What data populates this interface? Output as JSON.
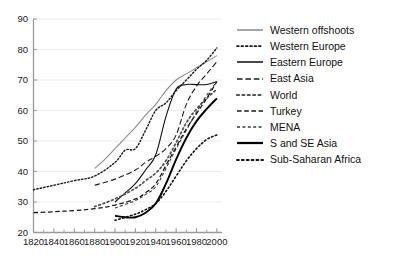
{
  "chart_data": {
    "type": "line",
    "title": "",
    "subtitle": "",
    "xlabel": "",
    "ylabel": "",
    "xlim": [
      1820,
      2005
    ],
    "ylim": [
      20,
      90
    ],
    "xticks": [
      1820,
      1840,
      1860,
      1880,
      1900,
      1920,
      1940,
      1960,
      1980,
      2000
    ],
    "xtick_labels": [
      "1820",
      "1840",
      "1860",
      "1880",
      "1900",
      "1920",
      "1940",
      "1960",
      "1980",
      "2000"
    ],
    "xminor_interval": 10,
    "yticks": [
      20,
      30,
      40,
      50,
      60,
      70,
      80,
      90
    ],
    "ytick_labels": [
      "20",
      "30",
      "40",
      "50",
      "60",
      "70",
      "80",
      "90"
    ],
    "grid": "horizontal",
    "legend_position": "right",
    "series": [
      {
        "name": "Western offshoots",
        "style": "solid",
        "width": 1.1,
        "color": "#8c8c8c",
        "x": [
          1880,
          1890,
          1900,
          1910,
          1920,
          1930,
          1940,
          1950,
          1960,
          1970,
          1980,
          1990,
          2000
        ],
        "values": [
          41.0,
          44.0,
          47.5,
          51.0,
          54.5,
          58.5,
          62.0,
          66.5,
          70.0,
          72.0,
          74.0,
          76.0,
          78.0
        ]
      },
      {
        "name": "Western Europe",
        "style": "dotted-fine",
        "width": 1.4,
        "color": "#1a1a1a",
        "x": [
          1820,
          1840,
          1860,
          1880,
          1900,
          1910,
          1920,
          1930,
          1940,
          1950,
          1960,
          1970,
          1980,
          1990,
          2000
        ],
        "values": [
          34.0,
          35.5,
          37.0,
          38.5,
          43.0,
          47.0,
          47.5,
          53.5,
          60.0,
          62.5,
          66.5,
          70.0,
          73.5,
          76.5,
          80.5
        ]
      },
      {
        "name": "Eastern Europe",
        "style": "solid",
        "width": 1.1,
        "color": "#111111",
        "x": [
          1900,
          1910,
          1920,
          1930,
          1940,
          1950,
          1960,
          1970,
          1980,
          1990,
          2000
        ],
        "values": [
          30.0,
          33.0,
          36.0,
          40.5,
          45.5,
          58.0,
          67.0,
          68.5,
          68.5,
          68.5,
          69.5
        ]
      },
      {
        "name": "East Asia",
        "style": "dashed-long",
        "width": 1.1,
        "color": "#1a1a1a",
        "x": [
          1880,
          1900,
          1920,
          1930,
          1940,
          1950,
          1960,
          1970,
          1980,
          1990,
          2000
        ],
        "values": [
          35.5,
          37.5,
          40.5,
          43.0,
          45.0,
          47.5,
          52.0,
          62.0,
          68.0,
          72.0,
          76.0
        ]
      },
      {
        "name": "World",
        "style": "dotted-coarse",
        "width": 1.8,
        "color": "#555555",
        "x": [
          1880,
          1900,
          1920,
          1930,
          1940,
          1950,
          1960,
          1970,
          1980,
          1990,
          2000
        ],
        "values": [
          28.5,
          31.0,
          34.5,
          37.0,
          39.5,
          43.5,
          49.5,
          56.0,
          60.5,
          64.0,
          67.0
        ]
      },
      {
        "name": "Turkey",
        "style": "dashed-medium",
        "width": 1.3,
        "color": "#1a1a1a",
        "x": [
          1820,
          1840,
          1860,
          1880,
          1900,
          1920,
          1930,
          1940,
          1950,
          1960,
          1970,
          1980,
          1990,
          2000
        ],
        "values": [
          26.5,
          26.8,
          27.2,
          27.8,
          29.0,
          31.0,
          33.0,
          36.0,
          42.0,
          48.0,
          54.0,
          59.0,
          64.0,
          69.5
        ]
      },
      {
        "name": "MENA",
        "style": "dashed-short",
        "width": 1.1,
        "color": "#3a3a3a",
        "x": [
          1900,
          1920,
          1930,
          1940,
          1950,
          1960,
          1970,
          1980,
          1990,
          2000
        ],
        "values": [
          28.0,
          30.5,
          32.5,
          35.0,
          41.0,
          47.5,
          53.5,
          59.5,
          65.0,
          69.5
        ]
      },
      {
        "name": "S and SE Asia",
        "style": "solid",
        "width": 1.9,
        "color": "#000000",
        "x": [
          1900,
          1910,
          1920,
          1930,
          1940,
          1950,
          1960,
          1970,
          1980,
          1990,
          2000
        ],
        "values": [
          25.5,
          25.0,
          25.0,
          26.5,
          29.5,
          36.0,
          44.0,
          51.0,
          56.5,
          60.5,
          64.0
        ]
      },
      {
        "name": "Sub-Saharan Africa",
        "style": "dotted-coarse",
        "width": 1.6,
        "color": "#111111",
        "x": [
          1900,
          1920,
          1930,
          1940,
          1950,
          1960,
          1970,
          1980,
          1990,
          2000
        ],
        "values": [
          24.0,
          26.0,
          27.5,
          29.5,
          33.5,
          38.5,
          43.5,
          47.5,
          50.5,
          52.0
        ]
      }
    ]
  },
  "legend": {
    "items": [
      {
        "label": "Western offshoots"
      },
      {
        "label": "Western Europe"
      },
      {
        "label": "Eastern Europe"
      },
      {
        "label": "East Asia"
      },
      {
        "label": "World"
      },
      {
        "label": "Turkey"
      },
      {
        "label": "MENA"
      },
      {
        "label": "S and SE Asia"
      },
      {
        "label": "Sub-Saharan Africa"
      }
    ]
  }
}
